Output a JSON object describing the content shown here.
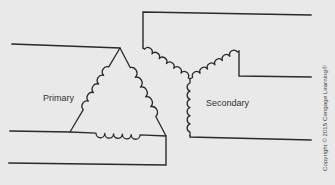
{
  "diagram": {
    "primary_label": "Primary",
    "secondary_label": "Secondary",
    "primary_connection": "delta",
    "secondary_connection": "wye",
    "copyright": "Copyright © 2015 Cengage Learning®"
  },
  "colors": {
    "background": "#e9e9e9",
    "line": "#2a2a2a"
  }
}
